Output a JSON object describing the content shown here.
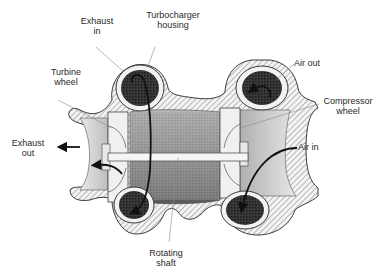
{
  "diagram": {
    "colors": {
      "background": "#ffffff",
      "outline": "#3a3a3a",
      "dark_chamber": "#2e2e2e",
      "housing_hatch": "#bdbdbd",
      "interior_gray": "#9a9a9a",
      "light_gray": "#e2e2e2",
      "arrow": "#111111",
      "leader_line": "#8a8a8a",
      "text": "#2a2a2a"
    },
    "labels": {
      "exhaust_in": {
        "line1": "Exhaust",
        "line2": "in"
      },
      "turbocharger_housing": {
        "line1": "Turbocharger",
        "line2": "housing"
      },
      "turbine_wheel": {
        "line1": "Turbine",
        "line2": "wheel"
      },
      "air_out": {
        "line1": "Air out"
      },
      "compressor_wheel": {
        "line1": "Compressor",
        "line2": "wheel"
      },
      "exhaust_out": {
        "line1": "Exhaust",
        "line2": "out"
      },
      "air_in": {
        "line1": "Air in"
      },
      "rotating_shaft": {
        "line1": "Rotating",
        "line2": "shaft"
      }
    },
    "flows": [
      {
        "name": "exhaust-in-flow",
        "from": "top-left volute",
        "to": "turbine wheel"
      },
      {
        "name": "exhaust-out-flow",
        "from": "turbine wheel",
        "to": "left outlet"
      },
      {
        "name": "air-in-flow",
        "from": "right inlet",
        "to": "bottom-right volute"
      },
      {
        "name": "air-out-flow",
        "from": "top-right volute",
        "to": "outlet"
      }
    ]
  }
}
